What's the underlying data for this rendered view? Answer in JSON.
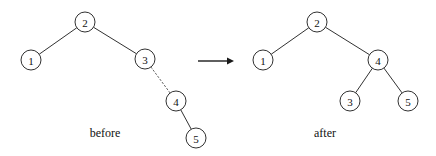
{
  "figure": {
    "width": 436,
    "height": 156,
    "background": "#ffffff",
    "stroke_color": "#1a1a1a",
    "dotted_color": "#555555",
    "node_radius": 10
  },
  "arrow": {
    "name": "transformation-arrow",
    "x1": 198,
    "y1": 61,
    "x2": 234,
    "y2": 61
  },
  "before": {
    "caption": "before",
    "caption_x": 105,
    "caption_y": 137,
    "nodes": [
      {
        "label": "2",
        "x": 85,
        "y": 22
      },
      {
        "label": "1",
        "x": 31,
        "y": 60
      },
      {
        "label": "3",
        "x": 145,
        "y": 59
      },
      {
        "label": "4",
        "x": 176,
        "y": 101
      },
      {
        "label": "5",
        "x": 196,
        "y": 138
      }
    ],
    "edges": [
      {
        "from": "2",
        "to": "1",
        "style": "solid"
      },
      {
        "from": "2",
        "to": "3",
        "style": "solid"
      },
      {
        "from": "3",
        "to": "4",
        "style": "dotted"
      },
      {
        "from": "4",
        "to": "5",
        "style": "solid"
      }
    ]
  },
  "after": {
    "caption": "after",
    "caption_x": 325,
    "caption_y": 137,
    "nodes": [
      {
        "label": "2",
        "x": 317,
        "y": 22
      },
      {
        "label": "1",
        "x": 263,
        "y": 60
      },
      {
        "label": "4",
        "x": 378,
        "y": 60
      },
      {
        "label": "3",
        "x": 350,
        "y": 101
      },
      {
        "label": "5",
        "x": 408,
        "y": 101
      }
    ],
    "edges": [
      {
        "from": "2",
        "to": "1",
        "style": "solid"
      },
      {
        "from": "2",
        "to": "4",
        "style": "solid"
      },
      {
        "from": "4",
        "to": "3",
        "style": "solid"
      },
      {
        "from": "4",
        "to": "5",
        "style": "solid"
      }
    ]
  }
}
